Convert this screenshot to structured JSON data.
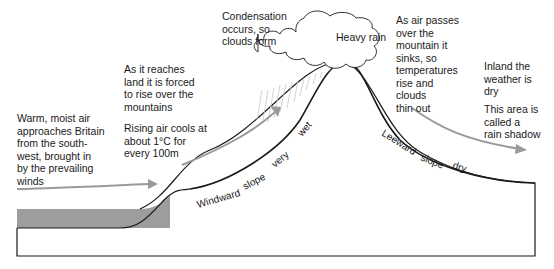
{
  "diagram": {
    "labels": {
      "warm_air": "Warm, moist air\napproaches Britain\nfrom the south-\nwest, brought in\nby the prevailing\nwinds",
      "reaches_land": "As it reaches\nland it is forced\nto rise over the\nmountains",
      "rising_cools": "Rising air cools at\nabout 1°C for\nevery 100m",
      "condensation": "Condensation\noccurs, so\nclouds form",
      "heavy_rain": "Heavy rain",
      "air_passes": "As air passes\nover the\nmountain it\nsinks, so\ntemperatures\nrise and\nclouds\nthin out",
      "inland_dry": "Inland the\nweather is\ndry",
      "rain_shadow": "This area is\ncalled a\nrain shadow"
    },
    "slope_labels": {
      "windward": "Windward",
      "windward_slope": "slope",
      "very": "very",
      "wet": "wet",
      "leeward": "Leeward",
      "leeward_slope": "slope",
      "dry": "dry"
    },
    "colors": {
      "outline": "#1a1a1a",
      "sea": "#8c8c8c",
      "arrow": "#9a9a9a",
      "rain": "#c8c8c8"
    }
  }
}
